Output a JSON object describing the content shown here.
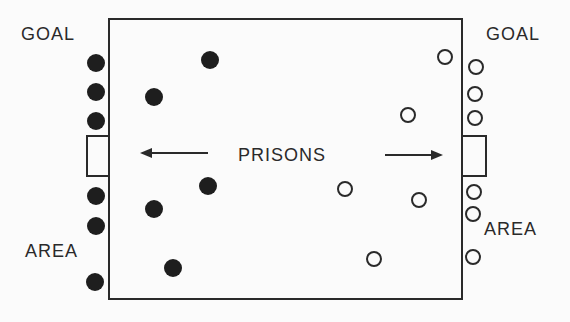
{
  "labels": {
    "goal_left": "GOAL",
    "goal_right": "GOAL",
    "area_left": "AREA",
    "area_right": "AREA",
    "prisons": "PRISONS"
  },
  "colors": {
    "line": "#2a2a2a",
    "filled_marker": "#1e1e1e",
    "background": "#fbfbfb"
  },
  "team_filled": [
    {
      "x": 96,
      "y": 63
    },
    {
      "x": 96,
      "y": 92
    },
    {
      "x": 96,
      "y": 121
    },
    {
      "x": 96,
      "y": 196
    },
    {
      "x": 96,
      "y": 226
    },
    {
      "x": 95,
      "y": 282
    },
    {
      "x": 210,
      "y": 60
    },
    {
      "x": 154,
      "y": 97
    },
    {
      "x": 208,
      "y": 186
    },
    {
      "x": 154,
      "y": 209
    },
    {
      "x": 173,
      "y": 268
    }
  ],
  "team_hollow": [
    {
      "x": 445,
      "y": 57
    },
    {
      "x": 476,
      "y": 67
    },
    {
      "x": 475,
      "y": 94
    },
    {
      "x": 475,
      "y": 118
    },
    {
      "x": 408,
      "y": 115
    },
    {
      "x": 345,
      "y": 189
    },
    {
      "x": 419,
      "y": 200
    },
    {
      "x": 474,
      "y": 192
    },
    {
      "x": 473,
      "y": 214
    },
    {
      "x": 374,
      "y": 259
    },
    {
      "x": 473,
      "y": 257
    }
  ]
}
